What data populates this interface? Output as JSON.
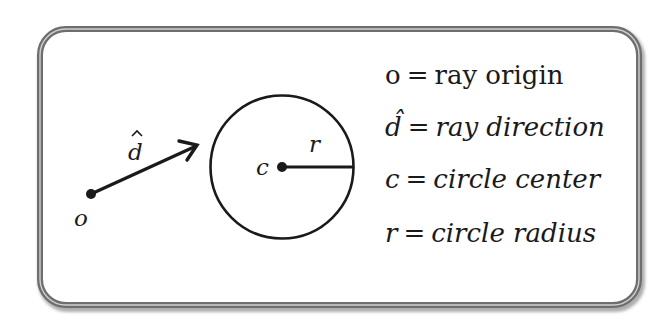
{
  "diagram": {
    "colors": {
      "frame_outer": "#6e6e6e",
      "frame_inner_highlight": "#d4d4d4",
      "frame_shadow": "#9a9a9a",
      "ink": "#1a1a1a",
      "background": "#ffffff"
    },
    "frame": {
      "x": 40,
      "y": 29,
      "width": 599,
      "height": 276,
      "corner_radius": 26
    },
    "ray": {
      "origin": {
        "x": 91,
        "y": 194
      },
      "tip": {
        "x": 197,
        "y": 145
      },
      "origin_label": "o",
      "direction_label": "d",
      "direction_label_hat": "^"
    },
    "circle": {
      "center": {
        "x": 282,
        "y": 167
      },
      "radius": 72,
      "center_label": "c",
      "radius_label": "r"
    },
    "legend": [
      {
        "symbol": "o",
        "symbol_style": "upright",
        "equals": "=",
        "description": "ray origin",
        "description_style": "upright"
      },
      {
        "symbol": "d̂",
        "symbol_style": "italic",
        "equals": "=",
        "description": "ray direction",
        "description_style": "italic"
      },
      {
        "symbol": "c",
        "symbol_style": "italic",
        "equals": "=",
        "description": "circle center",
        "description_style": "italic"
      },
      {
        "symbol": "r",
        "symbol_style": "italic",
        "equals": "=",
        "description": "circle radius",
        "description_style": "italic"
      }
    ]
  }
}
